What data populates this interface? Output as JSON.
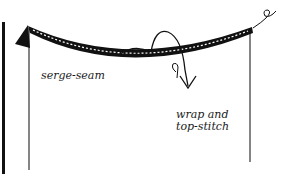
{
  "diagram": {
    "type": "sewing-illustration",
    "labels": {
      "serge_seam": "serge-seam",
      "wrap_line1": "wrap and",
      "wrap_line2": "top-stitch"
    },
    "colors": {
      "ink": "#111111",
      "background": "#ffffff"
    }
  }
}
